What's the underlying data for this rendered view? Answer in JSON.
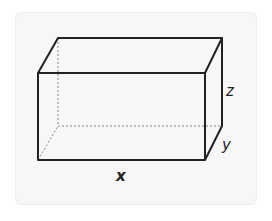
{
  "diagram": {
    "type": "rectangular-prism",
    "labels": {
      "length": "x",
      "depth": "y",
      "height": "z"
    },
    "colors": {
      "edge": "#222222",
      "hidden_edge": "#888888",
      "background": "#f7f7f7"
    }
  }
}
